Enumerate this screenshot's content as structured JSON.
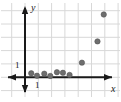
{
  "figure": {
    "title": "",
    "background_color": "#ffffff",
    "grid_color": "#d8d8d8",
    "axis_color": "#1a1a1a",
    "point_color": "#6e6e6e",
    "point_edge_color": "#4a4a4a"
  },
  "axes": {
    "x_label": "x",
    "y_label": "y",
    "x_tick_label": "1",
    "y_tick_label": "1"
  },
  "chart_data": {
    "type": "scatter",
    "title": "",
    "xlabel": "x",
    "ylabel": "y",
    "grid": true,
    "legend": null,
    "xlim": [
      -1.9,
      7.2
    ],
    "ylim": [
      -0.9,
      5.8
    ],
    "x_tick_labels": [
      "1"
    ],
    "y_tick_labels": [
      "1"
    ],
    "x_ticks": [
      1
    ],
    "y_ticks": [
      1
    ],
    "grid_spacing": 1,
    "series": [
      {
        "name": "data",
        "points": [
          {
            "x": 0.47,
            "y": 0.3
          },
          {
            "x": 0.9,
            "y": 0.12
          },
          {
            "x": 1.45,
            "y": 0.27
          },
          {
            "x": 1.9,
            "y": 0.1
          },
          {
            "x": 2.4,
            "y": 0.38
          },
          {
            "x": 2.85,
            "y": 0.34
          },
          {
            "x": 3.35,
            "y": 0.18
          },
          {
            "x": 4.28,
            "y": 1.1
          },
          {
            "x": 5.45,
            "y": 2.7
          },
          {
            "x": 5.92,
            "y": 4.72
          }
        ]
      }
    ]
  }
}
